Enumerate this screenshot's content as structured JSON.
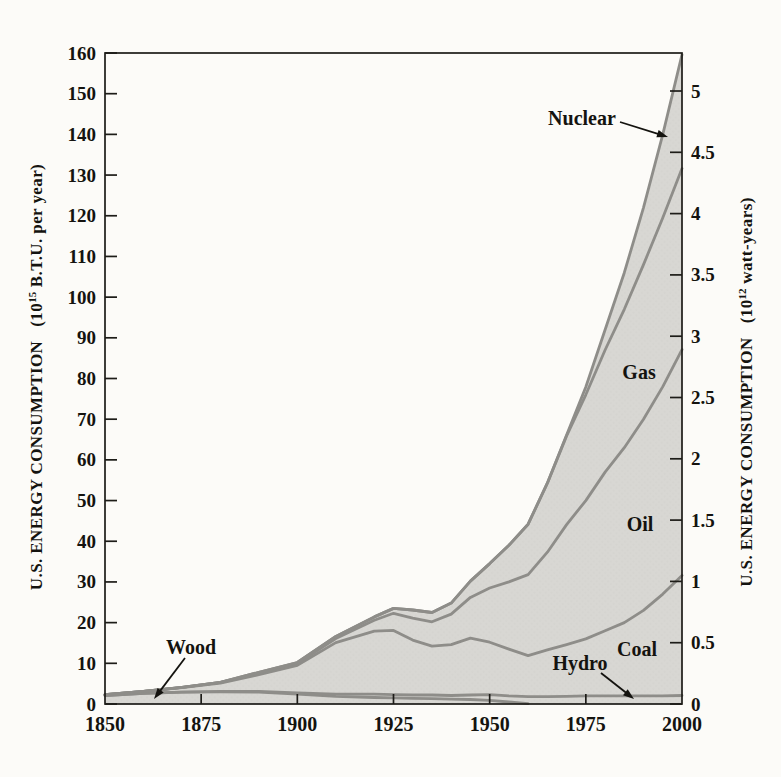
{
  "figure": {
    "background": "#fcfbf8",
    "area_fill": "#d8d7d3",
    "halftone_dot": "#bcbbb6",
    "curve_color": "#8e8d89",
    "axis_color": "#1d1c18",
    "text_color": "#14130f"
  },
  "left_axis": {
    "title_text": "U.S. ENERGY CONSUMPTION",
    "unit_prefix": "(10",
    "unit_exponent": "15",
    "unit_suffix": " B.T.U. per year)"
  },
  "right_axis": {
    "title_text": "U.S. ENERGY CONSUMPTION",
    "unit_prefix": "(10",
    "unit_exponent": "12",
    "unit_suffix": " watt-years)"
  },
  "chart_data": {
    "type": "area",
    "stacked": true,
    "title": "",
    "ylabel_left": "U.S. ENERGY CONSUMPTION (10^15 B.T.U. per year)",
    "ylabel_right": "U.S. ENERGY CONSUMPTION (10^12 watt-years)",
    "x_range": [
      1850,
      2000
    ],
    "ylim_left": [
      0,
      160
    ],
    "ylim_right": [
      0,
      5.31
    ],
    "grid": false,
    "x_ticks": [
      1850,
      1875,
      1900,
      1925,
      1950,
      1975,
      2000
    ],
    "y_ticks_left": [
      0,
      10,
      20,
      30,
      40,
      50,
      60,
      70,
      80,
      90,
      100,
      110,
      120,
      130,
      140,
      150,
      160
    ],
    "y_ticks_right": [
      0,
      0.5,
      1,
      1.5,
      2,
      2.5,
      3,
      3.5,
      4,
      4.5,
      5
    ],
    "stack_order": "bottom to top",
    "x": [
      1850,
      1860,
      1870,
      1880,
      1890,
      1900,
      1910,
      1920,
      1925,
      1930,
      1935,
      1940,
      1945,
      1950,
      1955,
      1960,
      1965,
      1970,
      1975,
      1980,
      1985,
      1990,
      1995,
      2000
    ],
    "series": [
      {
        "name": "Wood",
        "values": [
          2.1,
          2.6,
          2.9,
          3.0,
          2.9,
          2.4,
          1.9,
          1.6,
          1.5,
          1.4,
          1.3,
          1.2,
          1.1,
          0.9,
          0.5,
          0.1,
          0,
          0,
          0,
          0,
          0,
          0,
          0,
          0
        ]
      },
      {
        "name": "Hydro",
        "values": [
          0,
          0,
          0,
          0.1,
          0.2,
          0.3,
          0.5,
          0.8,
          0.8,
          0.8,
          0.9,
          0.9,
          1.1,
          1.4,
          1.5,
          1.7,
          1.8,
          1.9,
          2.0,
          2.0,
          2.0,
          2.0,
          2.0,
          2.1
        ]
      },
      {
        "name": "Coal",
        "values": [
          0.2,
          0.5,
          1.1,
          2.0,
          4.1,
          6.8,
          12.7,
          15.5,
          15.8,
          13.5,
          12.0,
          12.5,
          14.0,
          12.9,
          11.5,
          10.1,
          11.5,
          12.7,
          14.0,
          16.0,
          18.0,
          21.0,
          25.0,
          29.5
        ]
      },
      {
        "name": "Oil",
        "values": [
          0,
          0,
          0.1,
          0.2,
          0.3,
          0.4,
          1.0,
          2.7,
          4.2,
          5.4,
          6.0,
          7.5,
          10.0,
          13.3,
          16.5,
          19.9,
          24.0,
          29.5,
          34.0,
          39.0,
          43.0,
          47.0,
          51.0,
          55.5
        ]
      },
      {
        "name": "Gas",
        "values": [
          0,
          0,
          0,
          0,
          0.3,
          0.3,
          0.5,
          0.8,
          1.2,
          2.0,
          2.3,
          2.7,
          4.0,
          6.0,
          9.0,
          12.4,
          17.0,
          21.8,
          26.0,
          30.0,
          34.0,
          38.0,
          41.5,
          44.5
        ]
      },
      {
        "name": "Nuclear",
        "values": [
          0,
          0,
          0,
          0,
          0,
          0,
          0,
          0,
          0,
          0,
          0,
          0,
          0,
          0,
          0,
          0,
          0.05,
          0.2,
          1.9,
          5.0,
          9.0,
          14.0,
          20.5,
          28.0
        ]
      }
    ],
    "annotations": [
      {
        "name": "wood",
        "label": "Wood",
        "x": 191,
        "y": 647,
        "arrow": {
          "x1": 185,
          "y1": 658,
          "x2": 154,
          "y2": 699
        }
      },
      {
        "name": "nuclear",
        "label": "Nuclear",
        "x": 582,
        "y": 118,
        "arrow": {
          "x1": 620,
          "y1": 122,
          "x2": 668,
          "y2": 137
        }
      },
      {
        "name": "gas",
        "label": "Gas",
        "x": 639,
        "y": 372
      },
      {
        "name": "oil",
        "label": "Oil",
        "x": 640,
        "y": 524
      },
      {
        "name": "coal",
        "label": "Coal",
        "x": 637,
        "y": 649
      },
      {
        "name": "hydro",
        "label": "Hydro",
        "x": 580,
        "y": 663,
        "arrow": {
          "x1": 601,
          "y1": 673,
          "x2": 634,
          "y2": 699
        }
      }
    ]
  }
}
